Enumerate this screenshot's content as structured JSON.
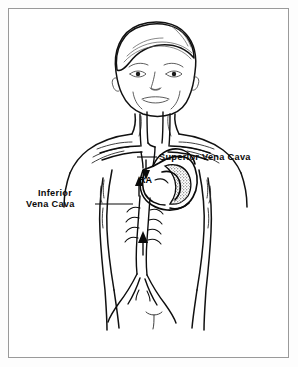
{
  "figure": {
    "type": "anatomical-illustration",
    "background_color": "#ffffff",
    "border_color": "#9a9a9a",
    "line_color": "#111111",
    "labels": {
      "superior_vena_cava": "Superior  Vena  Cava",
      "inferior_vena_cava_line1": "Inferior",
      "inferior_vena_cava_line2": "Vena  Cava",
      "right_atrium": "RA"
    },
    "annotations": [
      {
        "name": "superior-vena-cava",
        "text": "Superior  Vena  Cava",
        "leader_from_x": 137,
        "leader_to_x": 157,
        "leader_y": 157,
        "text_x": 159,
        "text_y": 160
      },
      {
        "name": "inferior-vena-cava",
        "text": "Inferior Vena  Cava",
        "leader_from_x": 95,
        "leader_to_x": 133,
        "leader_y": 204,
        "text_x": 34,
        "text_y": 195
      },
      {
        "name": "right-atrium",
        "text": "RA",
        "text_x": 138,
        "text_y": 182
      }
    ],
    "flow_arrows": [
      {
        "name": "svc-flow-arrow",
        "direction": "down",
        "vessel": "superior vena cava"
      },
      {
        "name": "ra-inflow-arrow",
        "direction": "up",
        "vessel": "inferior vena cava"
      },
      {
        "name": "ivc-mid-arrow",
        "direction": "up",
        "vessel": "inferior vena cava"
      },
      {
        "name": "ivc-lower-arrow",
        "direction": "up",
        "vessel": "inferior vena cava"
      }
    ]
  }
}
